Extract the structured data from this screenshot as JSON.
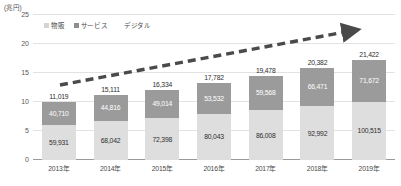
{
  "chart_data": {
    "type": "bar",
    "subtype": "stacked-bar-with-trend-arrow",
    "title": "",
    "unit_label": "(兆円)",
    "xlabel": "",
    "ylabel": "",
    "categories": [
      "2013年",
      "2014年",
      "2015年",
      "2016年",
      "2017年",
      "2018年",
      "2019年"
    ],
    "series": [
      {
        "name": "物販",
        "key": "goods",
        "color": "#dedede",
        "values": [
          59931,
          68042,
          72398,
          80043,
          86008,
          92992,
          100515
        ],
        "labels": [
          "59,931",
          "68,042",
          "72,398",
          "80,043",
          "86,008",
          "92,992",
          "100,515"
        ]
      },
      {
        "name": "サービス",
        "key": "service",
        "color": "#9b9b9b",
        "values": [
          40710,
          44816,
          49014,
          53532,
          59568,
          66471,
          71672
        ],
        "labels": [
          "40,710",
          "44,816",
          "49,014",
          "53,532",
          "59,568",
          "66,471",
          "71,672"
        ]
      },
      {
        "name": "デジタル",
        "key": "digital",
        "color": "#ffffff",
        "values": [
          11019,
          15111,
          16334,
          17782,
          19478,
          20382,
          21422
        ],
        "labels": [
          "11,019",
          "15,111",
          "16,334",
          "17,782",
          "19,478",
          "20,382",
          "21,422"
        ]
      }
    ],
    "totals": [
      111660,
      127969,
      137746,
      151357,
      165054,
      179845,
      193609
    ],
    "yticks": [
      "0",
      "5",
      "10",
      "15",
      "20",
      "25"
    ],
    "ytick_values": [
      0,
      5,
      10,
      15,
      20,
      25
    ],
    "ylim": [
      0,
      25
    ],
    "grid": true,
    "legend_position": "top-left",
    "annotations": [
      {
        "name": "growth-trend-arrow",
        "style": "dashed-arrow",
        "direction": "up-right",
        "color": "#4a4a4a"
      }
    ]
  },
  "legend": {
    "items": [
      {
        "label": "物販",
        "swatch": "goods-swatch"
      },
      {
        "label": "サービス",
        "swatch": "service-swatch"
      },
      {
        "label": "デジタル",
        "swatch": "digital-swatch"
      }
    ]
  },
  "axis": {
    "unit": "(兆円)",
    "zero": "0"
  }
}
